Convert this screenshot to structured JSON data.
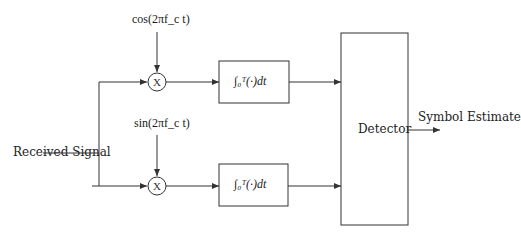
{
  "diagram": {
    "input_label": "Received Signal",
    "output_label": "Symbol Estimate",
    "carriers": {
      "top": "cos(2πf_c t)",
      "bottom": "sin(2πf_c t)"
    },
    "multiplier_symbol": "X",
    "integrator_label": "∫₀ᵀ(·)dt",
    "detector_label": "Detector",
    "colors": {
      "line": "#333333",
      "background": "#ffffff"
    }
  }
}
